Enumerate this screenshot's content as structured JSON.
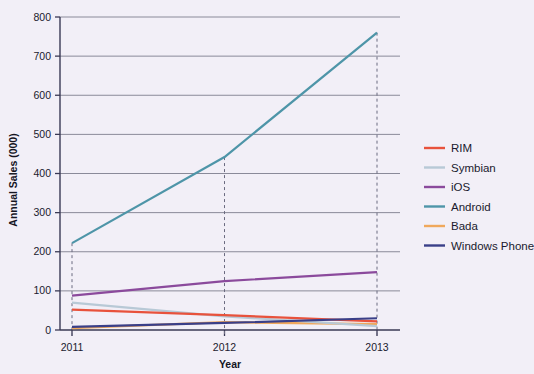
{
  "chart_data": {
    "type": "line",
    "title": "",
    "xlabel": "Year",
    "ylabel": "Annual Sales (000)",
    "categories": [
      "2011",
      "2012",
      "2013"
    ],
    "x": [
      2011,
      2012,
      2013
    ],
    "ylim": [
      0,
      800
    ],
    "yticks": [
      0,
      100,
      200,
      300,
      400,
      500,
      600,
      700,
      800
    ],
    "ytick_labels": [
      "0",
      "100",
      "200",
      "300",
      "400",
      "500",
      "600",
      "700",
      "800"
    ],
    "grid": true,
    "legend_position": "right",
    "series": [
      {
        "name": "RIM",
        "color": "#e8523c",
        "values": [
          52,
          38,
          22
        ]
      },
      {
        "name": "Symbian",
        "color": "#b8c9d6",
        "values": [
          70,
          35,
          10
        ]
      },
      {
        "name": "iOS",
        "color": "#8b4a9c",
        "values": [
          88,
          125,
          148
        ]
      },
      {
        "name": "Android",
        "color": "#4e95a8",
        "values": [
          222,
          442,
          760
        ]
      },
      {
        "name": "Bada",
        "color": "#f0a85c",
        "values": [
          5,
          20,
          15
        ]
      },
      {
        "name": "Windows Phone",
        "color": "#3a3f88",
        "values": [
          8,
          18,
          30
        ]
      }
    ]
  },
  "legend": {
    "items": [
      {
        "label": "RIM"
      },
      {
        "label": "Symbian"
      },
      {
        "label": "iOS"
      },
      {
        "label": "Android"
      },
      {
        "label": "Bada"
      },
      {
        "label": "Windows Phone"
      }
    ]
  },
  "axes": {
    "y_title": "Annual Sales (000)",
    "x_title": "Year",
    "y_labels": [
      "800",
      "700",
      "600",
      "500",
      "400",
      "300",
      "200",
      "100",
      "0"
    ],
    "x_labels": [
      "2011",
      "2012",
      "2013"
    ]
  },
  "colors": {
    "background": "#f2eff7",
    "grid": "#8a8a99",
    "axis": "#3a3a55"
  }
}
